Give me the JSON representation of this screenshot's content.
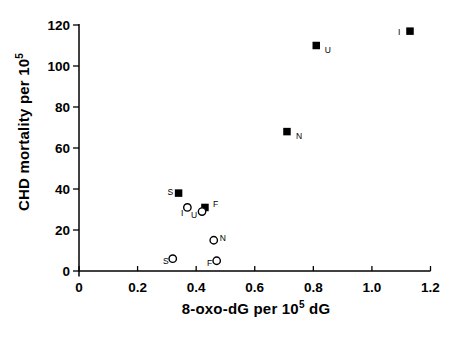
{
  "figure": {
    "background": "#ffffff",
    "ink": "#000000"
  },
  "chart_data": {
    "type": "scatter",
    "title": "",
    "xlabel": {
      "text": "8-oxo-dG per 10",
      "sup": "5",
      "suffix": " dG"
    },
    "ylabel": {
      "text": "CHD mortality per 10",
      "sup": "5"
    },
    "xlim": [
      0,
      1.2
    ],
    "ylim": [
      0,
      120
    ],
    "grid": false,
    "legend": "none",
    "x_ticks": [
      0,
      0.2,
      0.4,
      0.6,
      0.8,
      1.0,
      1.2
    ],
    "x_tick_labels": [
      "0",
      "0.2",
      "0.4",
      "0.6",
      "0.8",
      "1.0",
      "1.2"
    ],
    "y_ticks": [
      0,
      20,
      40,
      60,
      80,
      100,
      120
    ],
    "y_tick_labels": [
      "0",
      "20",
      "40",
      "60",
      "80",
      "100",
      "120"
    ],
    "series": [
      {
        "name": "filled-squares",
        "marker": "square",
        "fill": "#000000",
        "points": [
          {
            "label": "S",
            "x": 0.34,
            "y": 38,
            "label_dx": -5.5,
            "label_dy": 1.5,
            "label_anchor": "end"
          },
          {
            "label": "F",
            "x": 0.43,
            "y": 31,
            "label_dx": 8,
            "label_dy": 0,
            "label_anchor": "start"
          },
          {
            "label": "N",
            "x": 0.71,
            "y": 68,
            "label_dx": 9,
            "label_dy": 7,
            "label_anchor": "start"
          },
          {
            "label": "U",
            "x": 0.81,
            "y": 110,
            "label_dx": 8.5,
            "label_dy": 7,
            "label_anchor": "start"
          },
          {
            "label": "I",
            "x": 1.13,
            "y": 117,
            "label_dx": -9.5,
            "label_dy": 3.5,
            "label_anchor": "end"
          }
        ]
      },
      {
        "name": "open-circles",
        "marker": "circle",
        "stroke": "#000000",
        "fill": "#ffffff",
        "points": [
          {
            "label": "I",
            "x": 0.37,
            "y": 31,
            "label_dx": -4,
            "label_dy": 9,
            "label_anchor": "end"
          },
          {
            "label": "U",
            "x": 0.42,
            "y": 29,
            "label_dx": -5,
            "label_dy": 6,
            "label_anchor": "end"
          },
          {
            "label": "N",
            "x": 0.46,
            "y": 15,
            "label_dx": 6,
            "label_dy": 1,
            "label_anchor": "start"
          },
          {
            "label": "S",
            "x": 0.32,
            "y": 6,
            "label_dx": -4,
            "label_dy": 5,
            "label_anchor": "end"
          },
          {
            "label": "F",
            "x": 0.47,
            "y": 5,
            "label_dx": -4.5,
            "label_dy": 5.5,
            "label_anchor": "end"
          }
        ]
      }
    ]
  }
}
